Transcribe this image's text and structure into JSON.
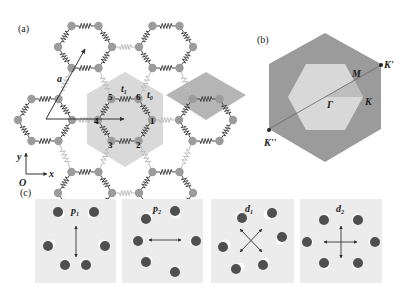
{
  "figure": {
    "panels": {
      "a": {
        "label": "(a)",
        "lattice_vector_label": "a",
        "hopping_labels": {
          "intra": "t",
          "intra_sub": "1",
          "inter": "t",
          "inter_sub": "0"
        },
        "site_labels": [
          "1",
          "2",
          "3",
          "4",
          "5",
          "6"
        ],
        "axes": {
          "origin": "O",
          "x": "x",
          "y": "y"
        },
        "colors": {
          "node": "#9c9c9c",
          "spring_intra": "#4a4a4a",
          "spring_inter": "#bdbdbd",
          "wigner_seitz": "#d9d9d9",
          "diamond": "#b3b3b3",
          "arrow": "#333333"
        }
      },
      "b": {
        "label": "(b)",
        "points": {
          "gamma": "Γ",
          "m": "M",
          "k": "K",
          "k_prime": "K'",
          "k_double_prime": "K''"
        },
        "colors": {
          "outer": "#9b9b9b",
          "inner": "#d8d8d8",
          "ibz": "#bdbdbd",
          "line": "#555555",
          "dot": "#222222"
        }
      },
      "c": {
        "label": "(c)",
        "modes": [
          {
            "name": "p",
            "sub": "1",
            "arrow": "vertical"
          },
          {
            "name": "p",
            "sub": "2",
            "arrow": "horizontal"
          },
          {
            "name": "d",
            "sub": "1",
            "arrow": "diagonal-cross"
          },
          {
            "name": "d",
            "sub": "2",
            "arrow": "cross"
          }
        ],
        "colors": {
          "background": "#ececec",
          "dot": "#4f4f4f",
          "ghost": "#ffffff",
          "arrow": "#333333"
        }
      }
    }
  }
}
